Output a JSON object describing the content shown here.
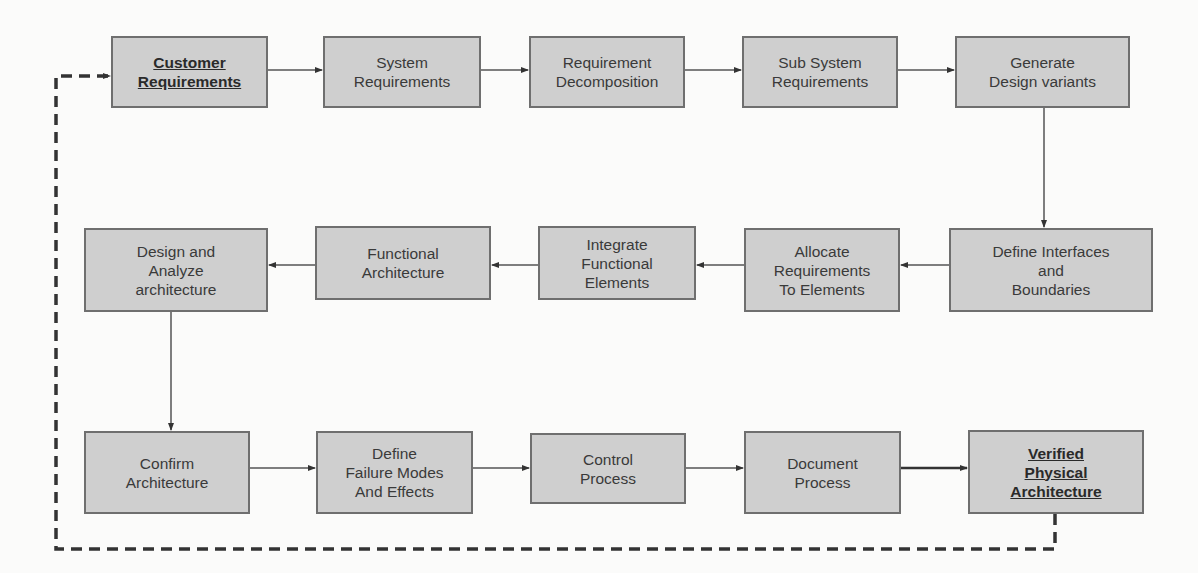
{
  "diagram": {
    "type": "flowchart",
    "colors": {
      "box_fill": "#cfcfcf",
      "box_border": "#6f6f6f",
      "line": "#555555",
      "dashed_line": "#333333",
      "background": "#fbfbfa"
    },
    "nodes": [
      {
        "id": "customer_requirements",
        "label": "Customer\nRequirements",
        "emphasized": true,
        "x": 111,
        "y": 36,
        "w": 157,
        "h": 72
      },
      {
        "id": "system_requirements",
        "label": "System\nRequirements",
        "x": 323,
        "y": 36,
        "w": 158,
        "h": 72
      },
      {
        "id": "requirement_decomposition",
        "label": "Requirement\nDecomposition",
        "x": 529,
        "y": 36,
        "w": 156,
        "h": 72
      },
      {
        "id": "sub_system_requirements",
        "label": "Sub System\nRequirements",
        "x": 742,
        "y": 36,
        "w": 156,
        "h": 72
      },
      {
        "id": "generate_design_variants",
        "label": "Generate\nDesign variants",
        "x": 955,
        "y": 36,
        "w": 175,
        "h": 72
      },
      {
        "id": "define_interfaces",
        "label": "Define Interfaces\nand\nBoundaries",
        "x": 949,
        "y": 228,
        "w": 204,
        "h": 84
      },
      {
        "id": "allocate_requirements",
        "label": "Allocate\nRequirements\nTo Elements",
        "x": 744,
        "y": 228,
        "w": 156,
        "h": 84
      },
      {
        "id": "integrate_functional",
        "label": "Integrate\nFunctional\nElements",
        "x": 538,
        "y": 226,
        "w": 158,
        "h": 74
      },
      {
        "id": "functional_architecture",
        "label": "Functional\nArchitecture",
        "x": 315,
        "y": 226,
        "w": 176,
        "h": 74
      },
      {
        "id": "design_analyze",
        "label": "Design and\nAnalyze\narchitecture",
        "x": 84,
        "y": 228,
        "w": 184,
        "h": 84
      },
      {
        "id": "confirm_architecture",
        "label": "Confirm\nArchitecture",
        "x": 84,
        "y": 431,
        "w": 166,
        "h": 83
      },
      {
        "id": "failure_modes",
        "label": "Define\nFailure Modes\nAnd Effects",
        "x": 316,
        "y": 431,
        "w": 157,
        "h": 83
      },
      {
        "id": "control_process",
        "label": "Control\nProcess",
        "x": 530,
        "y": 433,
        "w": 156,
        "h": 71
      },
      {
        "id": "document_process",
        "label": "Document\nProcess",
        "x": 744,
        "y": 431,
        "w": 157,
        "h": 83
      },
      {
        "id": "verified_physical",
        "label": "Verified\nPhysical\nArchitecture",
        "emphasized": true,
        "x": 968,
        "y": 430,
        "w": 176,
        "h": 84
      }
    ],
    "edges": [
      {
        "from": "customer_requirements",
        "to": "system_requirements"
      },
      {
        "from": "system_requirements",
        "to": "requirement_decomposition"
      },
      {
        "from": "requirement_decomposition",
        "to": "sub_system_requirements"
      },
      {
        "from": "sub_system_requirements",
        "to": "generate_design_variants"
      },
      {
        "from": "generate_design_variants",
        "to": "define_interfaces"
      },
      {
        "from": "define_interfaces",
        "to": "allocate_requirements"
      },
      {
        "from": "allocate_requirements",
        "to": "integrate_functional"
      },
      {
        "from": "integrate_functional",
        "to": "functional_architecture"
      },
      {
        "from": "functional_architecture",
        "to": "design_analyze"
      },
      {
        "from": "design_analyze",
        "to": "confirm_architecture"
      },
      {
        "from": "confirm_architecture",
        "to": "failure_modes"
      },
      {
        "from": "failure_modes",
        "to": "control_process"
      },
      {
        "from": "control_process",
        "to": "document_process"
      },
      {
        "from": "document_process",
        "to": "verified_physical"
      },
      {
        "from": "verified_physical",
        "to": "customer_requirements",
        "style": "dashed",
        "feedback": true
      }
    ]
  }
}
